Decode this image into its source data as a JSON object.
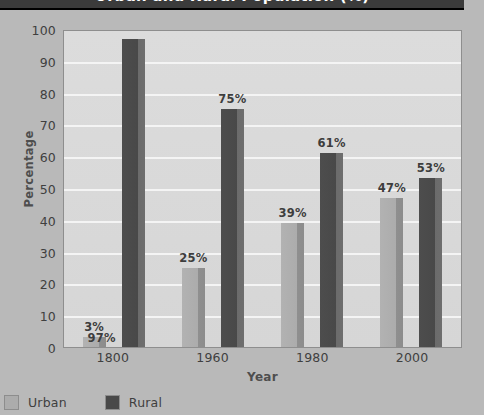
{
  "title": {
    "text": "Urban and Rural Population (%)"
  },
  "chart_data": {
    "type": "bar",
    "title": "Urban and Rural Population (%)",
    "xlabel": "Year",
    "ylabel": "Percentage",
    "ylim": [
      0,
      100
    ],
    "ytick_step": 10,
    "yticks": [
      "100",
      "90",
      "80",
      "70",
      "60",
      "50",
      "40",
      "30",
      "20",
      "10",
      "0"
    ],
    "grid": true,
    "legend_position": "bottom-left",
    "categories": [
      "1800",
      "1960",
      "1980",
      "2000"
    ],
    "series": [
      {
        "name": "Urban",
        "color": "#acacac",
        "values": [
          3,
          25,
          39,
          47
        ],
        "labels": [
          "3%",
          "25%",
          "39%",
          "47%"
        ]
      },
      {
        "name": "Rural",
        "color": "#494949",
        "values": [
          97,
          75,
          61,
          53
        ],
        "labels": [
          "97%",
          "75%",
          "61%",
          "53%"
        ]
      }
    ]
  },
  "colors": {
    "page_background": "#b9b9b9",
    "title_band": "#3b3b3b",
    "title_text": "#ffffff",
    "plot_background": "#d9d9d9",
    "gridline": "#f4f4f4",
    "axis_text": "#3f3f3f",
    "urban_bar": "#acacac",
    "rural_bar": "#494949"
  }
}
